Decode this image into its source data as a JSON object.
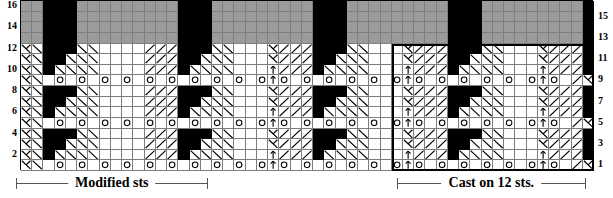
{
  "chart": {
    "columns": 51,
    "rows": 16,
    "cell_width": 11.23,
    "cell_height": 10.56,
    "colors": {
      "shaded": "#9b9b9b",
      "blank": "#ffffff",
      "black": "#000000",
      "gridline": "#7d7d7d",
      "outline": "#000000"
    },
    "row_numbers_left": [
      16,
      14,
      12,
      10,
      8,
      6,
      4,
      2
    ],
    "row_numbers_right": [
      15,
      13,
      11,
      9,
      7,
      5,
      3,
      1
    ],
    "legend_symbols": {
      "blank": "knit",
      "black": "no stitch",
      "shaded": "background / shaded area",
      "o": "yarn over",
      "right-slant": "ssk",
      "left-slant": "k2tog",
      "lambda": "centered decrease",
      "arrow-up": "make one"
    },
    "repeat_box": {
      "start_col": 33,
      "end_col": 50
    }
  },
  "brackets": [
    {
      "name": "modified-sts",
      "label": "Modified sts",
      "left": 40,
      "width": 488
    },
    {
      "name": "cast-on",
      "label": "Cast on 12 sts.",
      "left": 1008,
      "width": 480
    }
  ],
  "grid_rows": [
    "SSSSSBBBSSSSSSSSSSBBBSSSSSSSSSSSSBBBSSSSSSSSSSBBBSSS",
    "SSSSSBBBSSSSSSSSSSBBBSSSSSSSSSSSSBBBSSSSSSSSSSBBBSSS",
    "SSSSSBBBSSSSSSSSSSBBBSSSSSSSSSSSSBBBSSSSSSSSSSBBBSSS",
    "SSSSSBBBSSSSSSSSSSBBBSSSSSSSSSSSSBBBSSSSSSSSSSBBBSSS",
    "kKW.BBB.WWW....//.BBB./KKW....//.BBB./KKW....//.BBB/K",
    "kKW..BB.WW....//..BB../KKW...//..BB../KKW...//..BB/K",
    "kKW...B.W....//...B.../KKW..//...B.../KKW..//...B/K",
    "kKWo.o.o.o.o.o.o.o./KKWo.o.o.o.o.o.o./KKWo.o.o.o./K",
    "kKW.BBB.WWW....//.BBB./KKW....//.BBB./KKW....//.BBB/K",
    "kKW..BB.WW....//..BB../KKW...//..BB../KKW...//..BB/K",
    "kKW...B.W....//...B.../KKW..//...B.../KKW..//...B/K",
    "kKWo.o.o.o.o.o.o.o./KKWo.o.o.o.o.o.o./KKWo.o.o.o./K",
    "kKW.BBB.WWW....//.BBB./KKW....//.BBB./KKW....//.BBB/K",
    "kKW..BB.WW....//..BB../KKW...//..BB../KKW...//..BB/K",
    "kKW...B.W....//...B.../KKW..//...B.../KKW..//...B/K",
    "kKWo.o.o.o.o.o.o.o./KKWo.o.o.o.o.o.o./KKWo.o.o.o./K"
  ]
}
